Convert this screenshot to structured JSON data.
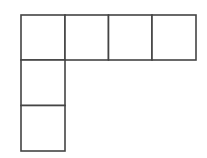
{
  "diagram": {
    "type": "grid-net",
    "stroke_color": "#444444",
    "background_color": "#ffffff",
    "stroke_width": 1.6,
    "cells": [
      {
        "id": "cell-r0-c0",
        "row": 0,
        "col": 0,
        "x": 21,
        "y": 15,
        "w": 44,
        "h": 45
      },
      {
        "id": "cell-r0-c1",
        "row": 0,
        "col": 1,
        "x": 65,
        "y": 15,
        "w": 43.5,
        "h": 45
      },
      {
        "id": "cell-r0-c2",
        "row": 0,
        "col": 2,
        "x": 108.5,
        "y": 15,
        "w": 43.5,
        "h": 45
      },
      {
        "id": "cell-r0-c3",
        "row": 0,
        "col": 3,
        "x": 152,
        "y": 15,
        "w": 44,
        "h": 45
      },
      {
        "id": "cell-r1-c0",
        "row": 1,
        "col": 0,
        "x": 21,
        "y": 60,
        "w": 44,
        "h": 45.5
      },
      {
        "id": "cell-r2-c0",
        "row": 2,
        "col": 0,
        "x": 21,
        "y": 105.5,
        "w": 44,
        "h": 45.5
      }
    ]
  }
}
